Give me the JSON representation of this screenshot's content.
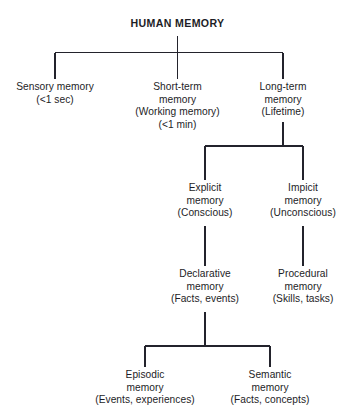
{
  "diagram": {
    "title": "HUMAN MEMORY",
    "type": "hierarchy-tree",
    "background_color": "#ffffff",
    "line_color": "#23232c",
    "text_color": "#1d1d26",
    "root": {
      "label": "HUMAN MEMORY"
    },
    "level_1": [
      {
        "name": "sensory-memory",
        "lines": [
          "Sensory memory",
          "(<1 sec)"
        ]
      },
      {
        "name": "short-term-memory",
        "lines": [
          "Short-term",
          "memory",
          "(Working memory)",
          "(<1 min)"
        ]
      },
      {
        "name": "long-term-memory",
        "lines": [
          "Long-term",
          "memory",
          "(Lifetime)"
        ]
      }
    ],
    "level_2": [
      {
        "name": "explicit-memory",
        "lines": [
          "Explicit",
          "memory",
          "(Conscious)"
        ]
      },
      {
        "name": "implicit-memory",
        "lines": [
          "Impicit",
          "memory",
          "(Unconscious)"
        ]
      }
    ],
    "level_3": [
      {
        "name": "declarative-memory",
        "lines": [
          "Declarative",
          "memory",
          "(Facts, events)"
        ]
      },
      {
        "name": "procedural-memory",
        "lines": [
          "Procedural",
          "memory",
          "(Skills, tasks)"
        ]
      }
    ],
    "level_4": [
      {
        "name": "episodic-memory",
        "lines": [
          "Episodic",
          "memory",
          "(Events, experiences)"
        ]
      },
      {
        "name": "semantic-memory",
        "lines": [
          "Semantic",
          "memory",
          "(Facts, concepts)"
        ]
      }
    ]
  }
}
